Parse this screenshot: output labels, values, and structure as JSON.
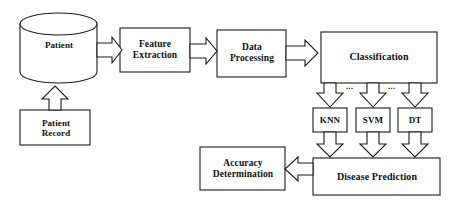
{
  "diagram": {
    "type": "flowchart",
    "stroke_color": "#1a1a1a",
    "fill_color": "#ffffff",
    "nodes": [
      {
        "id": "patient",
        "label": "Patient",
        "shape": "cylinder",
        "x": 20,
        "y": 13,
        "w": 77,
        "h": 70
      },
      {
        "id": "patient_record",
        "label": "Patient\nRecord",
        "shape": "rect",
        "x": 20,
        "y": 110,
        "w": 70,
        "h": 35
      },
      {
        "id": "feature",
        "label": "Feature\nExtraction",
        "shape": "rect",
        "x": 120,
        "y": 28,
        "w": 70,
        "h": 44
      },
      {
        "id": "dataproc",
        "label": "Data\nProcessing",
        "shape": "rect",
        "x": 217,
        "y": 30,
        "w": 69,
        "h": 47
      },
      {
        "id": "classification",
        "label": "Classification",
        "shape": "rect",
        "x": 321,
        "y": 32,
        "w": 116,
        "h": 51
      },
      {
        "id": "knn",
        "label": "KNN",
        "shape": "rect",
        "x": 313,
        "y": 108,
        "w": 34,
        "h": 24
      },
      {
        "id": "svm",
        "label": "SVM",
        "shape": "rect",
        "x": 356,
        "y": 108,
        "w": 34,
        "h": 24
      },
      {
        "id": "dt",
        "label": "DT",
        "shape": "rect",
        "x": 398,
        "y": 108,
        "w": 34,
        "h": 24
      },
      {
        "id": "disease",
        "label": "Disease Prediction",
        "shape": "rect",
        "x": 313,
        "y": 158,
        "w": 127,
        "h": 37
      },
      {
        "id": "accuracy",
        "label": "Accuracy\nDetermination",
        "shape": "rect",
        "x": 200,
        "y": 147,
        "w": 85,
        "h": 43
      }
    ],
    "labels": {
      "patient": "Patient",
      "patient_record_line1": "Patient",
      "patient_record_line2": "Record",
      "feature_line1": "Feature",
      "feature_line2": "Extraction",
      "dataproc_line1": "Data",
      "dataproc_line2": "Processing",
      "classification": "Classification",
      "knn": "KNN",
      "svm": "SVM",
      "dt": "DT",
      "disease": "Disease Prediction",
      "accuracy_line1": "Accuracy",
      "accuracy_line2": "Determination",
      "ellipsis_1": "...",
      "ellipsis_2": "..."
    },
    "edges": [
      {
        "from": "patient_record",
        "to": "patient",
        "style": "block-arrow",
        "direction": "up"
      },
      {
        "from": "patient",
        "to": "feature",
        "style": "block-arrow",
        "direction": "right"
      },
      {
        "from": "feature",
        "to": "dataproc",
        "style": "block-arrow",
        "direction": "right"
      },
      {
        "from": "dataproc",
        "to": "classification",
        "style": "block-arrow",
        "direction": "right"
      },
      {
        "from": "classification",
        "to": "knn",
        "style": "block-arrow",
        "direction": "down"
      },
      {
        "from": "classification",
        "to": "svm",
        "style": "block-arrow",
        "direction": "down"
      },
      {
        "from": "classification",
        "to": "dt",
        "style": "block-arrow",
        "direction": "down"
      },
      {
        "from": "knn",
        "to": "disease",
        "style": "block-arrow",
        "direction": "down"
      },
      {
        "from": "svm",
        "to": "disease",
        "style": "block-arrow",
        "direction": "down"
      },
      {
        "from": "dt",
        "to": "disease",
        "style": "block-arrow",
        "direction": "down"
      },
      {
        "from": "disease",
        "to": "accuracy",
        "style": "block-arrow",
        "direction": "left"
      }
    ]
  }
}
